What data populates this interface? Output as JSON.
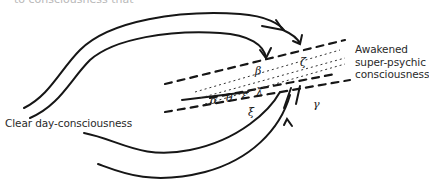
{
  "figure": {
    "top_cut_text": "to consciousness that",
    "labels": {
      "right_line1": "Awakened",
      "right_line2": "super-psychic",
      "right_line3": "consciousness",
      "left": "Clear day-consciousness"
    },
    "glyphs": {
      "alpha": "α",
      "beta": "β",
      "gamma": "γ",
      "delta": "δ",
      "epsilon": "ε",
      "zeta": "ζ",
      "eta": "η",
      "theta": "θ"
    },
    "colors": {
      "ink": "#161616",
      "text": "#2a2a2a",
      "background": "#ffffff"
    }
  }
}
